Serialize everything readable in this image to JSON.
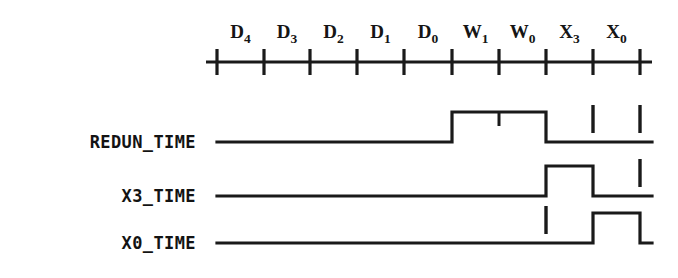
{
  "figure": {
    "kind": "digital-timing-diagram",
    "background_color": "#ffffff",
    "stroke_color": "#1a1a1a",
    "width": 678,
    "height": 278
  },
  "time_axis": {
    "name": "time-axis",
    "line_y": 62,
    "x_start": 206,
    "x_end": 652,
    "tick_half_height": 13,
    "tick_positions": [
      217,
      264,
      310,
      357,
      404,
      452,
      499,
      546,
      593,
      640
    ],
    "intervals": [
      {
        "id": "D4",
        "base": "D",
        "sub": "4",
        "x_center": 240.5
      },
      {
        "id": "D3",
        "base": "D",
        "sub": "3",
        "x_center": 287.0
      },
      {
        "id": "D2",
        "base": "D",
        "sub": "2",
        "x_center": 333.5
      },
      {
        "id": "D1",
        "base": "D",
        "sub": "1",
        "x_center": 380.5
      },
      {
        "id": "D0",
        "base": "D",
        "sub": "0",
        "x_center": 428.0
      },
      {
        "id": "W1",
        "base": "W",
        "sub": "1",
        "x_center": 475.5
      },
      {
        "id": "W0",
        "base": "W",
        "sub": "0",
        "x_center": 522.5
      },
      {
        "id": "X3",
        "base": "X",
        "sub": "3",
        "x_center": 569.5
      },
      {
        "id": "X0",
        "base": "X",
        "sub": "0",
        "x_center": 616.5
      }
    ],
    "label_baseline_y": 38
  },
  "signals": [
    {
      "name": "REDUN_TIME",
      "label": "REDUN_TIME",
      "label_x": 196,
      "label_baseline_y": 148,
      "baseline_y": 142,
      "high_y": 112,
      "line_x_start": 217,
      "line_x_end": 652,
      "pulses": [
        {
          "rise_x": 452,
          "fall_x": 546
        }
      ],
      "notches": [
        {
          "x": 499,
          "depth": 14
        }
      ],
      "event_marks": [
        {
          "x": 593,
          "top_y": 105,
          "bottom_y": 133
        },
        {
          "x": 640,
          "top_y": 105,
          "bottom_y": 133
        }
      ]
    },
    {
      "name": "X3_TIME",
      "label": "X3_TIME",
      "label_x": 196,
      "label_baseline_y": 202,
      "baseline_y": 196,
      "high_y": 166,
      "line_x_start": 217,
      "line_x_end": 652,
      "pulses": [
        {
          "rise_x": 546,
          "fall_x": 593
        }
      ],
      "notches": [],
      "event_marks": [
        {
          "x": 640,
          "top_y": 159,
          "bottom_y": 187
        }
      ]
    },
    {
      "name": "X0_TIME",
      "label": "X0_TIME",
      "label_x": 196,
      "label_baseline_y": 249,
      "baseline_y": 243,
      "high_y": 213,
      "line_x_start": 217,
      "line_x_end": 652,
      "pulses": [
        {
          "rise_x": 593,
          "fall_x": 640
        }
      ],
      "notches": [],
      "event_marks": [
        {
          "x": 546,
          "top_y": 206,
          "bottom_y": 234
        }
      ]
    }
  ],
  "chart_data": {
    "type": "line",
    "title": "",
    "xlabel": "",
    "ylabel": "",
    "x_tick_labels": [
      "D4",
      "D3",
      "D2",
      "D1",
      "D0",
      "W1",
      "W0",
      "X3",
      "X0"
    ],
    "legend": [],
    "grid": false,
    "series": [
      {
        "name": "REDUN_TIME",
        "values": [
          0,
          0,
          0,
          0,
          0,
          1,
          1,
          0,
          0
        ],
        "high_intervals": [
          "W1",
          "W0"
        ]
      },
      {
        "name": "X3_TIME",
        "values": [
          0,
          0,
          0,
          0,
          0,
          0,
          0,
          1,
          0
        ],
        "high_intervals": [
          "X3"
        ]
      },
      {
        "name": "X0_TIME",
        "values": [
          0,
          0,
          0,
          0,
          0,
          0,
          0,
          0,
          1
        ],
        "high_intervals": [
          "X0"
        ]
      }
    ]
  }
}
